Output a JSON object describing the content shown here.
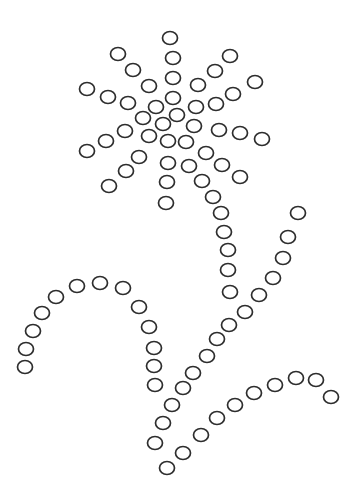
{
  "picture": {
    "subject": "dot-pattern flower with stem and leaves",
    "background": "#ffffff",
    "dot_color": "#2e2e2e",
    "dot_rx": 7.5,
    "dot_ry": 6.5,
    "groups": [
      {
        "name": "flower-head",
        "dots": [
          [
            170,
            38
          ],
          [
            118,
            54
          ],
          [
            173,
            58
          ],
          [
            230,
            56
          ],
          [
            133,
            70
          ],
          [
            215,
            71
          ],
          [
            173,
            78
          ],
          [
            255,
            82
          ],
          [
            149,
            86
          ],
          [
            198,
            85
          ],
          [
            87,
            89
          ],
          [
            108,
            97
          ],
          [
            128,
            103
          ],
          [
            173,
            98
          ],
          [
            233,
            94
          ],
          [
            216,
            104
          ],
          [
            196,
            107
          ],
          [
            156,
            107
          ],
          [
            177,
            115
          ],
          [
            143,
            118
          ],
          [
            163,
            124
          ],
          [
            194,
            126
          ],
          [
            125,
            131
          ],
          [
            219,
            130
          ],
          [
            240,
            133
          ],
          [
            262,
            139
          ],
          [
            106,
            141
          ],
          [
            149,
            136
          ],
          [
            168,
            141
          ],
          [
            186,
            142
          ],
          [
            87,
            151
          ],
          [
            139,
            157
          ],
          [
            206,
            153
          ],
          [
            168,
            163
          ],
          [
            189,
            166
          ],
          [
            222,
            165
          ],
          [
            126,
            171
          ],
          [
            240,
            177
          ],
          [
            202,
            181
          ],
          [
            167,
            182
          ],
          [
            109,
            186
          ],
          [
            213,
            197
          ],
          [
            166,
            203
          ],
          [
            221,
            213
          ]
        ]
      },
      {
        "name": "stem",
        "dots": [
          [
            224,
            232
          ],
          [
            228,
            250
          ],
          [
            228,
            270
          ],
          [
            230,
            292
          ]
        ]
      },
      {
        "name": "right-leaf",
        "dots": [
          [
            298,
            213
          ],
          [
            288,
            237
          ],
          [
            283,
            258
          ],
          [
            273,
            278
          ],
          [
            259,
            295
          ],
          [
            245,
            312
          ],
          [
            229,
            325
          ],
          [
            217,
            339
          ],
          [
            207,
            356
          ],
          [
            193,
            373
          ],
          [
            183,
            388
          ],
          [
            172,
            405
          ],
          [
            163,
            423
          ],
          [
            155,
            443
          ]
        ]
      },
      {
        "name": "left-leaf",
        "dots": [
          [
            25,
            367
          ],
          [
            26,
            349
          ],
          [
            33,
            331
          ],
          [
            42,
            313
          ],
          [
            56,
            297
          ],
          [
            77,
            286
          ],
          [
            100,
            283
          ],
          [
            123,
            288
          ],
          [
            139,
            307
          ],
          [
            149,
            327
          ],
          [
            154,
            348
          ],
          [
            154,
            366
          ],
          [
            155,
            385
          ]
        ]
      },
      {
        "name": "bottom-leaf",
        "dots": [
          [
            167,
            468
          ],
          [
            183,
            453
          ],
          [
            201,
            435
          ],
          [
            217,
            418
          ],
          [
            235,
            405
          ],
          [
            254,
            393
          ],
          [
            275,
            385
          ],
          [
            296,
            378
          ],
          [
            316,
            380
          ],
          [
            331,
            397
          ]
        ]
      }
    ]
  }
}
